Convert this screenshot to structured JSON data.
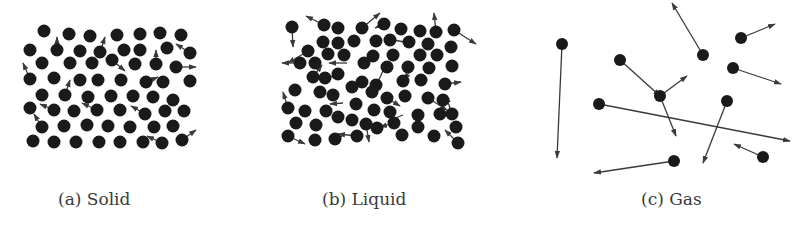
{
  "figure": {
    "panels": [
      {
        "id": "solid",
        "caption": "(a) Solid",
        "caption_pos": [
          58,
          205
        ],
        "radius": 6.5,
        "particles": [
          [
            44,
            31
          ],
          [
            69,
            34
          ],
          [
            90,
            36
          ],
          [
            117,
            35
          ],
          [
            140,
            34
          ],
          [
            160,
            33
          ],
          [
            181,
            35
          ],
          [
            30,
            50
          ],
          [
            57,
            50
          ],
          [
            80,
            51
          ],
          [
            100,
            52
          ],
          [
            124,
            50
          ],
          [
            140,
            50
          ],
          [
            167,
            48
          ],
          [
            190,
            53
          ],
          [
            42,
            63
          ],
          [
            70,
            63
          ],
          [
            92,
            63
          ],
          [
            112,
            60
          ],
          [
            135,
            64
          ],
          [
            156,
            64
          ],
          [
            176,
            67
          ],
          [
            30,
            79
          ],
          [
            54,
            78
          ],
          [
            80,
            80
          ],
          [
            98,
            80
          ],
          [
            121,
            80
          ],
          [
            146,
            82
          ],
          [
            163,
            82
          ],
          [
            190,
            81
          ],
          [
            42,
            95
          ],
          [
            65,
            95
          ],
          [
            88,
            97
          ],
          [
            111,
            96
          ],
          [
            133,
            96
          ],
          [
            153,
            97
          ],
          [
            173,
            100
          ],
          [
            30,
            108
          ],
          [
            54,
            110
          ],
          [
            74,
            111
          ],
          [
            97,
            110
          ],
          [
            120,
            110
          ],
          [
            145,
            114
          ],
          [
            165,
            111
          ],
          [
            184,
            111
          ],
          [
            42,
            127
          ],
          [
            64,
            126
          ],
          [
            87,
            125
          ],
          [
            108,
            126
          ],
          [
            130,
            127
          ],
          [
            154,
            127
          ],
          [
            173,
            126
          ],
          [
            33,
            141
          ],
          [
            54,
            142
          ],
          [
            76,
            142
          ],
          [
            99,
            142
          ],
          [
            120,
            142
          ],
          [
            143,
            142
          ],
          [
            162,
            143
          ],
          [
            182,
            140
          ]
        ],
        "arrows": [
          [
            57,
            50,
            57,
            37
          ],
          [
            100,
            52,
            105,
            37
          ],
          [
            30,
            79,
            23,
            63
          ],
          [
            112,
            60,
            125,
            71
          ],
          [
            146,
            82,
            158,
            77
          ],
          [
            190,
            53,
            176,
            44
          ],
          [
            176,
            67,
            196,
            67
          ],
          [
            65,
            95,
            70,
            80
          ],
          [
            54,
            110,
            40,
            104
          ],
          [
            97,
            110,
            82,
            103
          ],
          [
            145,
            114,
            131,
            106
          ],
          [
            42,
            127,
            34,
            114
          ],
          [
            162,
            143,
            147,
            136
          ],
          [
            182,
            140,
            196,
            130
          ],
          [
            156,
            64,
            156,
            50
          ]
        ]
      },
      {
        "id": "liquid",
        "caption": "(b) Liquid",
        "caption_pos": [
          322,
          205
        ],
        "radius": 6.5,
        "particles": [
          [
            292,
            27
          ],
          [
            324,
            25
          ],
          [
            338,
            28
          ],
          [
            362,
            28
          ],
          [
            384,
            24
          ],
          [
            401,
            29
          ],
          [
            420,
            31
          ],
          [
            436,
            32
          ],
          [
            454,
            30
          ],
          [
            323,
            42
          ],
          [
            338,
            43
          ],
          [
            354,
            41
          ],
          [
            376,
            41
          ],
          [
            390,
            40
          ],
          [
            409,
            42
          ],
          [
            428,
            44
          ],
          [
            451,
            47
          ],
          [
            308,
            51
          ],
          [
            328,
            54
          ],
          [
            344,
            55
          ],
          [
            373,
            56
          ],
          [
            393,
            55
          ],
          [
            420,
            55
          ],
          [
            437,
            55
          ],
          [
            300,
            63
          ],
          [
            315,
            63
          ],
          [
            364,
            63
          ],
          [
            387,
            67
          ],
          [
            408,
            67
          ],
          [
            429,
            68
          ],
          [
            452,
            66
          ],
          [
            313,
            77
          ],
          [
            325,
            78
          ],
          [
            338,
            74
          ],
          [
            362,
            82
          ],
          [
            376,
            85
          ],
          [
            403,
            81
          ],
          [
            421,
            80
          ],
          [
            445,
            84
          ],
          [
            295,
            90
          ],
          [
            320,
            92
          ],
          [
            333,
            95
          ],
          [
            352,
            87
          ],
          [
            372,
            92
          ],
          [
            387,
            98
          ],
          [
            405,
            96
          ],
          [
            428,
            98
          ],
          [
            443,
            100
          ],
          [
            288,
            108
          ],
          [
            305,
            111
          ],
          [
            326,
            111
          ],
          [
            356,
            104
          ],
          [
            374,
            110
          ],
          [
            390,
            112
          ],
          [
            418,
            115
          ],
          [
            440,
            114
          ],
          [
            452,
            114
          ],
          [
            296,
            123
          ],
          [
            316,
            125
          ],
          [
            338,
            117
          ],
          [
            352,
            120
          ],
          [
            366,
            124
          ],
          [
            394,
            123
          ],
          [
            418,
            127
          ],
          [
            456,
            127
          ],
          [
            288,
            136
          ],
          [
            315,
            140
          ],
          [
            335,
            139
          ],
          [
            357,
            136
          ],
          [
            377,
            128
          ],
          [
            402,
            135
          ],
          [
            434,
            136
          ],
          [
            458,
            143
          ]
        ],
        "arrows": [
          [
            292,
            27,
            293,
            47
          ],
          [
            308,
            51,
            288,
            63
          ],
          [
            324,
            25,
            306,
            16
          ],
          [
            362,
            28,
            380,
            13
          ],
          [
            436,
            32,
            434,
            13
          ],
          [
            454,
            30,
            476,
            44
          ],
          [
            300,
            63,
            282,
            63
          ],
          [
            313,
            77,
            322,
            65
          ],
          [
            288,
            108,
            283,
            92
          ],
          [
            325,
            78,
            339,
            75
          ],
          [
            347,
            63,
            329,
            63
          ],
          [
            384,
            24,
            375,
            28
          ],
          [
            377,
            84,
            387,
            62
          ],
          [
            404,
            42,
            389,
            39
          ],
          [
            412,
            68,
            404,
            80
          ],
          [
            446,
            84,
            461,
            82
          ],
          [
            382,
            95,
            400,
            106
          ],
          [
            428,
            98,
            447,
            110
          ],
          [
            452,
            114,
            446,
            96
          ],
          [
            403,
            115,
            388,
            121
          ],
          [
            366,
            124,
            369,
            142
          ],
          [
            357,
            136,
            338,
            134
          ],
          [
            394,
            123,
            380,
            127
          ],
          [
            288,
            136,
            305,
            144
          ],
          [
            458,
            143,
            445,
            130
          ],
          [
            343,
            103,
            330,
            104
          ],
          [
            337,
            139,
            342,
            136
          ]
        ]
      },
      {
        "id": "gas",
        "caption": "(c) Gas",
        "caption_pos": [
          641,
          205
        ],
        "radius": 6,
        "particles": [
          [
            562,
            44
          ],
          [
            620,
            60
          ],
          [
            599,
            104
          ],
          [
            660,
            96
          ],
          [
            703,
            55
          ],
          [
            741,
            38
          ],
          [
            733,
            68
          ],
          [
            727,
            101
          ],
          [
            674,
            161
          ],
          [
            763,
            157
          ]
        ],
        "arrows": [
          [
            562,
            44,
            557,
            158
          ],
          [
            620,
            60,
            660,
            96
          ],
          [
            660,
            96,
            687,
            76
          ],
          [
            660,
            96,
            676,
            136
          ],
          [
            599,
            104,
            790,
            141
          ],
          [
            703,
            55,
            672,
            3
          ],
          [
            741,
            38,
            775,
            24
          ],
          [
            733,
            68,
            781,
            84
          ],
          [
            727,
            101,
            703,
            163
          ],
          [
            674,
            161,
            594,
            173
          ],
          [
            763,
            157,
            734,
            144
          ]
        ]
      }
    ]
  }
}
